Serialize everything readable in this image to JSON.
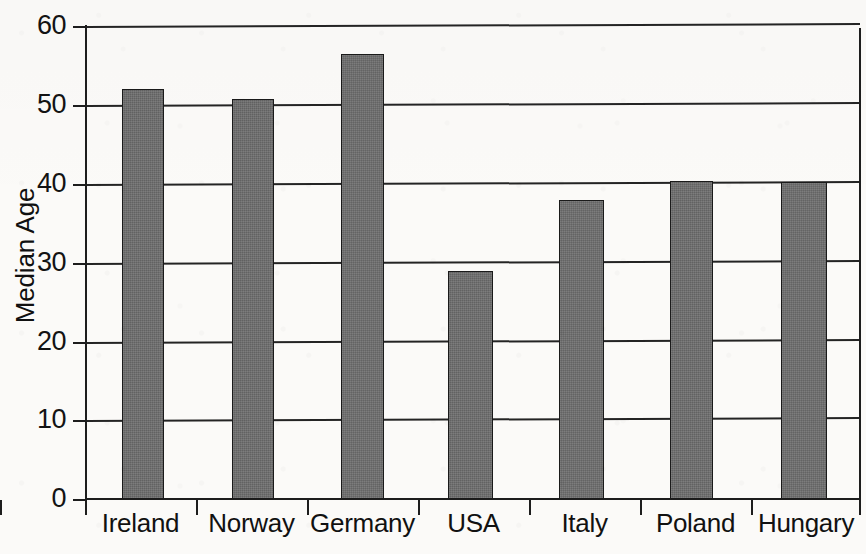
{
  "chart_data": {
    "type": "bar",
    "title": "",
    "subtitle": "",
    "xlabel": "",
    "ylabel": "Median Age",
    "categories": [
      "Ireland",
      "Norway",
      "Germany",
      "USA",
      "Italy",
      "Poland",
      "Hungary"
    ],
    "values": [
      52.0,
      50.7,
      56.4,
      28.9,
      37.9,
      40.4,
      40.2
    ],
    "series": [
      {
        "name": "Median Age",
        "values": [
          52.0,
          50.7,
          56.4,
          28.9,
          37.9,
          40.4,
          40.2
        ]
      }
    ],
    "ylim": [
      0,
      60
    ],
    "yticks": [
      0,
      10,
      20,
      30,
      40,
      50,
      60
    ],
    "ytick_labels": [
      "0",
      "10",
      "20",
      "30",
      "40",
      "50",
      "60"
    ],
    "grid": "horizontal",
    "legend": "none",
    "annotations": [],
    "bar_color": "#6e6e6e",
    "bar_edge_color": "#1a1a1a",
    "axis_color": "#1d1d1d",
    "background_color": "#fbfaf8"
  },
  "axis": {
    "y_title": "Median Age",
    "ticks": [
      {
        "label": "60",
        "value": 60
      },
      {
        "label": "50",
        "value": 50
      },
      {
        "label": "40",
        "value": 40
      },
      {
        "label": "30",
        "value": 30
      },
      {
        "label": "20",
        "value": 20
      },
      {
        "label": "10",
        "value": 10
      },
      {
        "label": "0",
        "value": 0
      }
    ]
  },
  "bars": [
    {
      "label": "Ireland",
      "value": 52.0
    },
    {
      "label": "Norway",
      "value": 50.7
    },
    {
      "label": "Germany",
      "value": 56.4
    },
    {
      "label": "USA",
      "value": 28.9
    },
    {
      "label": "Italy",
      "value": 37.9
    },
    {
      "label": "Poland",
      "value": 40.4
    },
    {
      "label": "Hungary",
      "value": 40.2
    }
  ]
}
